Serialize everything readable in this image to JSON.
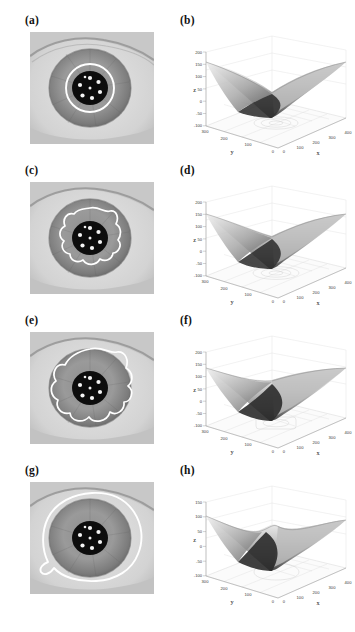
{
  "figure": {
    "background": "#ffffff",
    "contour_color": "#ffffff",
    "panel_count": 8,
    "rows": [
      {
        "image_panel": {
          "label": "(a)",
          "name": "eye-image-a",
          "contour_style": "circle",
          "contour_description": "tight smooth white circle around pupil",
          "highlight_count": 8
        },
        "plot_panel": {
          "label": "(b)",
          "name": "surface-plot-b"
        },
        "chart": {
          "type": "surface",
          "title": "",
          "xlabel": "x",
          "ylabel": "y",
          "zlabel": "z",
          "xticks": [
            "0",
            "100",
            "200",
            "300",
            "400"
          ],
          "yticks": [
            "0",
            "100",
            "200",
            "300"
          ],
          "zticks": [
            "200",
            "150",
            "100",
            "50",
            "0",
            "-50",
            "-100"
          ],
          "xlim": [
            0,
            400
          ],
          "ylim": [
            0,
            300
          ],
          "zlim": [
            -100,
            200
          ],
          "peak_z": 150,
          "valley_z": -100,
          "grid": true,
          "description": "saddle surface with central ridge peak and deep front valley"
        }
      },
      {
        "image_panel": {
          "label": "(c)",
          "name": "eye-image-c",
          "contour_style": "wavy",
          "contour_description": "irregular wavy white contour, medium radius",
          "highlight_count": 8
        },
        "plot_panel": {
          "label": "(d)",
          "name": "surface-plot-d"
        },
        "chart": {
          "type": "surface",
          "title": "",
          "xlabel": "x",
          "ylabel": "y",
          "zlabel": "z",
          "xticks": [
            "0",
            "100",
            "200",
            "300",
            "400"
          ],
          "yticks": [
            "0",
            "100",
            "200",
            "300"
          ],
          "zticks": [
            "200",
            "150",
            "100",
            "50",
            "0",
            "-50",
            "-100"
          ],
          "xlim": [
            0,
            400
          ],
          "ylim": [
            0,
            300
          ],
          "zlim": [
            -100,
            200
          ],
          "peak_z": 160,
          "valley_z": -100,
          "grid": true,
          "description": "saddle surface with taller narrow central peak"
        }
      },
      {
        "image_panel": {
          "label": "(e)",
          "name": "eye-image-e",
          "contour_style": "lobed",
          "contour_description": "large lobed white contour enclosing most of iris",
          "highlight_count": 8
        },
        "plot_panel": {
          "label": "(f)",
          "name": "surface-plot-f"
        },
        "chart": {
          "type": "surface",
          "title": "",
          "xlabel": "x",
          "ylabel": "y",
          "zlabel": "z",
          "xticks": [
            "0",
            "100",
            "200",
            "300",
            "400"
          ],
          "yticks": [
            "0",
            "100",
            "200",
            "300"
          ],
          "zticks": [
            "200",
            "150",
            "100",
            "50",
            "0",
            "-50",
            "-100"
          ],
          "xlim": [
            0,
            400
          ],
          "ylim": [
            0,
            300
          ],
          "zlim": [
            -100,
            200
          ],
          "peak_z": 170,
          "valley_z": -100,
          "grid": true,
          "description": "saddle surface with sharp tall central spike"
        }
      },
      {
        "image_panel": {
          "label": "(g)",
          "name": "eye-image-g",
          "contour_style": "smooth-large",
          "contour_description": "largest smooth rounded white contour touching image borders",
          "highlight_count": 8
        },
        "plot_panel": {
          "label": "(h)",
          "name": "surface-plot-h"
        },
        "chart": {
          "type": "surface",
          "title": "",
          "xlabel": "x",
          "ylabel": "y",
          "zlabel": "z",
          "xticks": [
            "0",
            "100",
            "200",
            "300",
            "400"
          ],
          "yticks": [
            "0",
            "100",
            "200",
            "300"
          ],
          "zticks": [
            "150",
            "100",
            "50",
            "0",
            "-50",
            "-100"
          ],
          "xlim": [
            0,
            400
          ],
          "ylim": [
            0,
            300
          ],
          "zlim": [
            -100,
            150
          ],
          "peak_z": 120,
          "valley_z": -100,
          "grid": true,
          "description": "saddle surface with broad rippled central ridge"
        }
      }
    ]
  }
}
